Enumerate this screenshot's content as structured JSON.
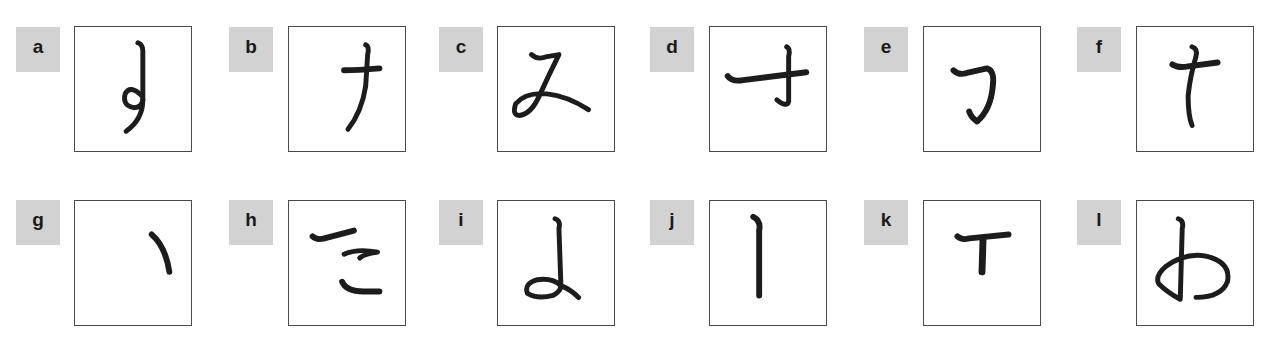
{
  "figure": {
    "stroke_color": "#1c1c1c",
    "label_background": "#d2d2d2",
    "panel_border": "#4a4a4a",
    "panels": [
      {
        "label": "a",
        "glyph": "vertical stroke with loop hook"
      },
      {
        "label": "b",
        "glyph": "ナ"
      },
      {
        "label": "c",
        "glyph": "み-like stroke"
      },
      {
        "label": "d",
        "glyph": "オ-like stroke"
      },
      {
        "label": "e",
        "glyph": "フ"
      },
      {
        "label": "f",
        "glyph": "ナ upright"
      },
      {
        "label": "g",
        "glyph": "ヽ"
      },
      {
        "label": "h",
        "glyph": "こ-like strokes"
      },
      {
        "label": "i",
        "glyph": "よ-like loop"
      },
      {
        "label": "j",
        "glyph": "丨"
      },
      {
        "label": "k",
        "glyph": "T"
      },
      {
        "label": "l",
        "glyph": "わ-like stroke"
      }
    ]
  }
}
